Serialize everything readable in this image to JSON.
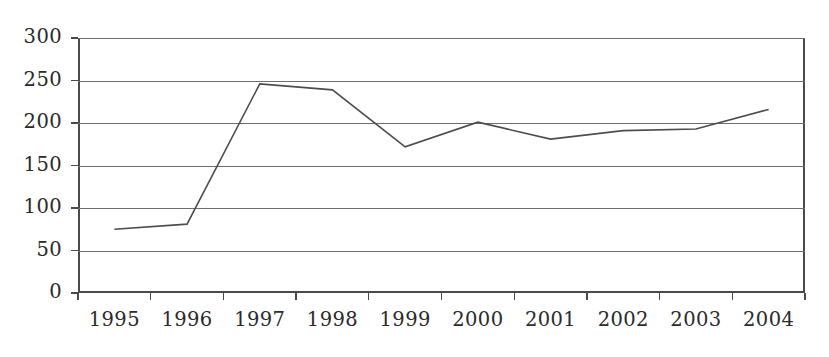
{
  "chart_data": {
    "type": "line",
    "title": "",
    "subtitle": "",
    "xlabel": "",
    "ylabel": "",
    "categories": [
      "1995",
      "1996",
      "1997",
      "1998",
      "1999",
      "2000",
      "2001",
      "2002",
      "2003",
      "2004"
    ],
    "series": [
      {
        "name": "",
        "values": [
          75,
          81,
          246,
          239,
          172,
          201,
          181,
          191,
          193,
          216
        ]
      }
    ],
    "values": [
      75,
      81,
      246,
      239,
      172,
      201,
      181,
      191,
      193,
      216
    ],
    "ylim": [
      0,
      300
    ],
    "y_ticks": [
      0,
      50,
      100,
      150,
      200,
      250,
      300
    ],
    "y_tick_labels": [
      "0",
      "50",
      "100",
      "150",
      "200",
      "250",
      "300"
    ],
    "x_tick_labels": [
      "1995",
      "1996",
      "1997",
      "1998",
      "1999",
      "2000",
      "2001",
      "2002",
      "2003",
      "2004"
    ],
    "grid": true,
    "grid_axis": "y",
    "legend": false,
    "legend_position": "none",
    "markers": false,
    "annotations": [],
    "colors": {
      "line": "#4d4d4d",
      "axis": "#4a4a4a",
      "grid": "#6d6d6d",
      "text": "#2b2b2b",
      "background": "#ffffff"
    }
  }
}
